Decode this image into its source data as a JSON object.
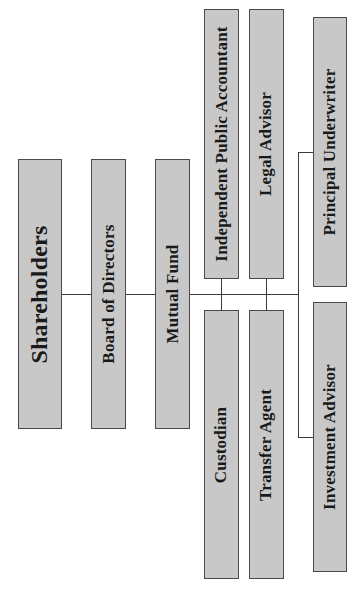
{
  "diagram": {
    "colors": {
      "box_fill": "#c8c8c8",
      "box_border": "#4a4a4a",
      "line": "#3a3a3a",
      "text": "#1a1a1a",
      "background": "#ffffff"
    },
    "orientation": "rotated -90deg (text reads bottom-to-top)",
    "nodes": {
      "shareholders": {
        "label": "Shareholders"
      },
      "board": {
        "label": "Board of Directors"
      },
      "fund": {
        "label": "Mutual Fund"
      },
      "accountant": {
        "label": "Independent Public Accountant"
      },
      "legal": {
        "label": "Legal Advisor"
      },
      "underwriter": {
        "label": "Principal Underwriter"
      },
      "custodian": {
        "label": "Custodian"
      },
      "transfer": {
        "label": "Transfer Agent"
      },
      "investment": {
        "label": "Investment Advisor"
      }
    },
    "edges": [
      [
        "Shareholders",
        "Board of Directors"
      ],
      [
        "Board of Directors",
        "Mutual Fund"
      ],
      [
        "Mutual Fund",
        "Independent Public Accountant"
      ],
      [
        "Mutual Fund",
        "Custodian"
      ],
      [
        "Mutual Fund",
        "Legal Advisor"
      ],
      [
        "Mutual Fund",
        "Transfer Agent"
      ],
      [
        "Mutual Fund",
        "Principal Underwriter"
      ],
      [
        "Mutual Fund",
        "Investment Advisor"
      ]
    ]
  }
}
